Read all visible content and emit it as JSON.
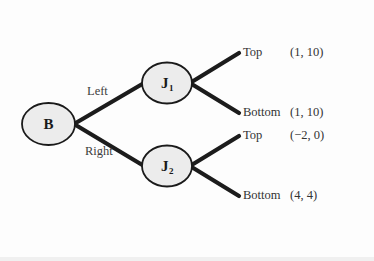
{
  "diagram": {
    "type": "game-tree",
    "background_color": "#fdfdfd",
    "node_fill_color": "#ececec",
    "node_stroke_color": "#1a1a1a",
    "branch_color": "#1c1c1c"
  },
  "nodes": {
    "root": {
      "label": "B",
      "subscript": ""
    },
    "upper": {
      "label": "J",
      "subscript": "1"
    },
    "lower": {
      "label": "J",
      "subscript": "2"
    }
  },
  "edges": {
    "root_upper": "Left",
    "root_lower": "Right",
    "upper_top": "Top",
    "upper_bottom": "Bottom",
    "lower_top": "Top",
    "lower_bottom": "Bottom"
  },
  "payoffs": {
    "upper_top": "(1, 10)",
    "upper_bottom": "(1, 10)",
    "lower_top": "(−2, 0)",
    "lower_bottom": "(4, 4)"
  }
}
